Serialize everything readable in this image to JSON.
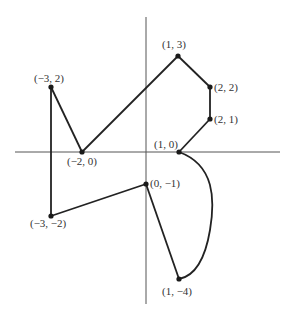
{
  "diagram": {
    "type": "coordinate-plane-path",
    "colors": {
      "axis": "#555555",
      "line": "#222222",
      "point": "#1a1a1a",
      "label": "#333333"
    },
    "axes": {
      "origin_px": [
        146,
        152
      ],
      "unit_px": 32,
      "x_axis": {
        "from_px": 15,
        "to_px": 280
      },
      "y_axis": {
        "from_px": 17,
        "to_px": 304
      }
    },
    "points": [
      {
        "id": "p1",
        "label": "(1, 3)",
        "x": 1,
        "y": 3
      },
      {
        "id": "p2",
        "label": "(2, 2)",
        "x": 2,
        "y": 2
      },
      {
        "id": "p3",
        "label": "(2, 1)",
        "x": 2,
        "y": 1
      },
      {
        "id": "p4",
        "label": "(1, 0)",
        "x": 1,
        "y": 0
      },
      {
        "id": "p5",
        "label": "(1, −4)",
        "x": 1,
        "y": -4
      },
      {
        "id": "p6",
        "label": "(0, −1)",
        "x": 0,
        "y": -1
      },
      {
        "id": "p7",
        "label": "(−3, −2)",
        "x": -3,
        "y": -2
      },
      {
        "id": "p8",
        "label": "(−3, 2)",
        "x": -3,
        "y": 2
      },
      {
        "id": "p9",
        "label": "(−2, 0)",
        "x": -2,
        "y": 0
      }
    ],
    "segments": [
      {
        "from": "(-2, 0)",
        "to": "(1, 3)",
        "kind": "line"
      },
      {
        "from": "(1, 3)",
        "to": "(2, 2)",
        "kind": "line"
      },
      {
        "from": "(2, 2)",
        "to": "(2, 1)",
        "kind": "line"
      },
      {
        "from": "(2, 1)",
        "to": "(1, 0)",
        "kind": "line"
      },
      {
        "from": "(1, 0)",
        "to": "(1, -4)",
        "kind": "curve"
      },
      {
        "from": "(1, -4)",
        "to": "(0, -1)",
        "kind": "line"
      },
      {
        "from": "(0, -1)",
        "to": "(-3, -2)",
        "kind": "line"
      },
      {
        "from": "(-3, -2)",
        "to": "(-3, 2)",
        "kind": "line"
      },
      {
        "from": "(-3, 2)",
        "to": "(-2, 0)",
        "kind": "line"
      }
    ]
  }
}
